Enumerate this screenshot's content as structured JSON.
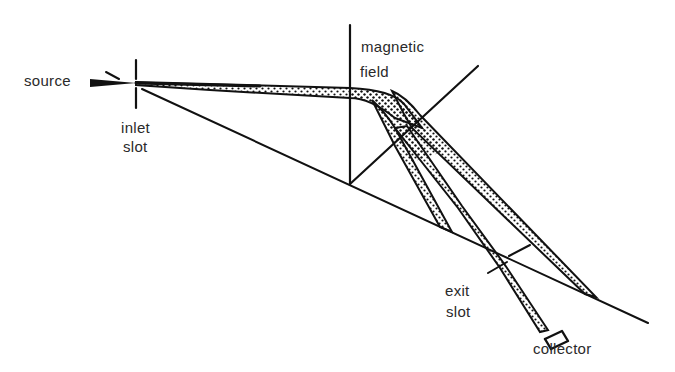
{
  "diagram": {
    "labels": {
      "source": "source",
      "inlet_line1": "inlet",
      "inlet_line2": "slot",
      "magnetic_line1": "magnetic",
      "magnetic_line2": "field",
      "exit_line1": "exit",
      "exit_line2": "slot",
      "collector": "collector"
    },
    "colors": {
      "ink": "#111111",
      "text": "#2a2a2a",
      "background": "#ffffff"
    }
  }
}
